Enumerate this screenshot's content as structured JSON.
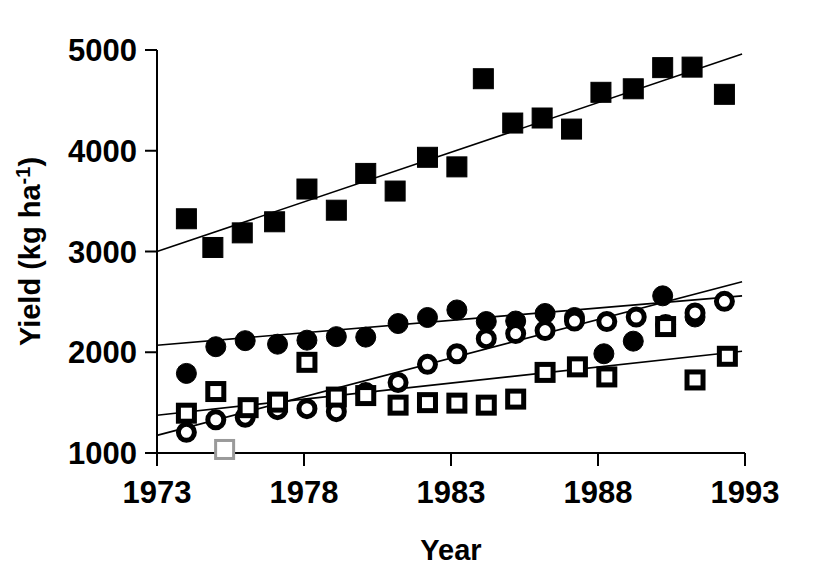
{
  "chart_data": {
    "type": "scatter",
    "title": "",
    "xlabel": "Year",
    "ylabel": "Yield (kg ha-1)",
    "ylabel_base": "Yield (kg ha",
    "ylabel_sup": "-1",
    "ylabel_tail": ")",
    "xlim": [
      1973,
      1993
    ],
    "ylim": [
      1000,
      5000
    ],
    "grid": false,
    "legend": "none",
    "x_ticks": [
      1973,
      1978,
      1983,
      1988,
      1993
    ],
    "x_tick_labels": [
      "1973",
      "1978",
      "1983",
      "1988",
      "1993"
    ],
    "y_ticks": [
      1000,
      2000,
      3000,
      4000,
      5000
    ],
    "y_tick_labels": [
      "1000",
      "2000",
      "3000",
      "4000",
      "5000"
    ],
    "series": [
      {
        "name": "filled-square-series",
        "marker": "filled-square",
        "color": "#000000",
        "points": [
          {
            "x": 1974.0,
            "y": 3325
          },
          {
            "x": 1974.9,
            "y": 3040
          },
          {
            "x": 1975.9,
            "y": 3185
          },
          {
            "x": 1977.0,
            "y": 3295
          },
          {
            "x": 1978.1,
            "y": 3620
          },
          {
            "x": 1979.1,
            "y": 3410
          },
          {
            "x": 1980.1,
            "y": 3775
          },
          {
            "x": 1981.1,
            "y": 3600
          },
          {
            "x": 1982.2,
            "y": 3935
          },
          {
            "x": 1983.2,
            "y": 3840
          },
          {
            "x": 1984.1,
            "y": 4715
          },
          {
            "x": 1985.1,
            "y": 4275
          },
          {
            "x": 1986.1,
            "y": 4325
          },
          {
            "x": 1987.1,
            "y": 4215
          },
          {
            "x": 1988.1,
            "y": 4580
          },
          {
            "x": 1989.2,
            "y": 4615
          },
          {
            "x": 1990.2,
            "y": 4825
          },
          {
            "x": 1991.2,
            "y": 4830
          },
          {
            "x": 1992.3,
            "y": 4560
          }
        ],
        "trend": {
          "x0": 1973,
          "y0": 3000,
          "x1": 1992.9,
          "y1": 4960
        }
      },
      {
        "name": "filled-circle-series",
        "marker": "filled-circle",
        "color": "#000000",
        "points": [
          {
            "x": 1974.0,
            "y": 1790
          },
          {
            "x": 1975.0,
            "y": 2055
          },
          {
            "x": 1976.0,
            "y": 2115
          },
          {
            "x": 1977.1,
            "y": 2080
          },
          {
            "x": 1978.1,
            "y": 2120
          },
          {
            "x": 1979.1,
            "y": 2155
          },
          {
            "x": 1980.1,
            "y": 2150
          },
          {
            "x": 1981.2,
            "y": 2285
          },
          {
            "x": 1982.2,
            "y": 2345
          },
          {
            "x": 1983.2,
            "y": 2420
          },
          {
            "x": 1984.2,
            "y": 2305
          },
          {
            "x": 1985.2,
            "y": 2310
          },
          {
            "x": 1986.2,
            "y": 2385
          },
          {
            "x": 1987.2,
            "y": 2345
          },
          {
            "x": 1988.2,
            "y": 1985
          },
          {
            "x": 1989.2,
            "y": 2110
          },
          {
            "x": 1990.2,
            "y": 2560
          },
          {
            "x": 1991.3,
            "y": 2350
          }
        ],
        "trend": {
          "x0": 1973,
          "y0": 2070,
          "x1": 1992.9,
          "y1": 2560
        }
      },
      {
        "name": "open-circle-series",
        "marker": "open-circle",
        "color": "#000000",
        "points": [
          {
            "x": 1974.0,
            "y": 1205
          },
          {
            "x": 1975.0,
            "y": 1330
          },
          {
            "x": 1976.0,
            "y": 1355
          },
          {
            "x": 1977.1,
            "y": 1430
          },
          {
            "x": 1978.1,
            "y": 1440
          },
          {
            "x": 1979.1,
            "y": 1410
          },
          {
            "x": 1980.1,
            "y": 1600
          },
          {
            "x": 1981.2,
            "y": 1700
          },
          {
            "x": 1982.2,
            "y": 1880
          },
          {
            "x": 1983.2,
            "y": 1985
          },
          {
            "x": 1984.2,
            "y": 2135
          },
          {
            "x": 1985.2,
            "y": 2185
          },
          {
            "x": 1986.2,
            "y": 2215
          },
          {
            "x": 1987.2,
            "y": 2310
          },
          {
            "x": 1988.3,
            "y": 2305
          },
          {
            "x": 1989.3,
            "y": 2350
          },
          {
            "x": 1990.3,
            "y": 2275
          },
          {
            "x": 1991.3,
            "y": 2390
          },
          {
            "x": 1992.3,
            "y": 2505
          }
        ],
        "trend": {
          "x0": 1973,
          "y0": 1175,
          "x1": 1992.9,
          "y1": 2700
        }
      },
      {
        "name": "open-square-series",
        "marker": "open-square",
        "color": "#000000",
        "points": [
          {
            "x": 1974.0,
            "y": 1395
          },
          {
            "x": 1975.0,
            "y": 1610
          },
          {
            "x": 1976.1,
            "y": 1450
          },
          {
            "x": 1977.1,
            "y": 1505
          },
          {
            "x": 1978.1,
            "y": 1900
          },
          {
            "x": 1979.1,
            "y": 1555
          },
          {
            "x": 1980.1,
            "y": 1570
          },
          {
            "x": 1981.2,
            "y": 1475
          },
          {
            "x": 1982.2,
            "y": 1500
          },
          {
            "x": 1983.2,
            "y": 1495
          },
          {
            "x": 1984.2,
            "y": 1475
          },
          {
            "x": 1985.2,
            "y": 1535
          },
          {
            "x": 1986.2,
            "y": 1800
          },
          {
            "x": 1987.3,
            "y": 1855
          },
          {
            "x": 1988.3,
            "y": 1755
          },
          {
            "x": 1990.3,
            "y": 2255
          },
          {
            "x": 1991.3,
            "y": 1725
          },
          {
            "x": 1992.4,
            "y": 1960
          }
        ],
        "trend": {
          "x0": 1973,
          "y0": 1375,
          "x1": 1992.9,
          "y1": 2010
        }
      },
      {
        "name": "ghost-open-square",
        "marker": "ghost-square",
        "color": "#9a9a9a",
        "points": [
          {
            "x": 1975.3,
            "y": 1035
          }
        ]
      }
    ]
  }
}
